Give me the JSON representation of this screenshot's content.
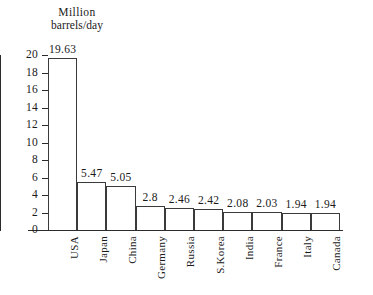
{
  "chart_data": {
    "type": "bar",
    "title": "",
    "ylabel_line1": "Million",
    "ylabel_line2": "barrels/day",
    "xlabel": "",
    "ylim": [
      0,
      20
    ],
    "ytick_step": 2,
    "yticks": [
      "20",
      "18",
      "16",
      "14",
      "12",
      "10",
      "8",
      "6",
      "4",
      "2",
      "0"
    ],
    "grid": false,
    "legend": false,
    "categories": [
      "USA",
      "Japan",
      "China",
      "Germany",
      "Russia",
      "S.Korea",
      "India",
      "France",
      "Italy",
      "Canada"
    ],
    "values": [
      19.63,
      5.47,
      5.05,
      2.8,
      2.46,
      2.42,
      2.08,
      2.03,
      1.94,
      1.94
    ],
    "value_labels": [
      "19.63",
      "5.47",
      "5.05",
      "2.8",
      "2.46",
      "2.42",
      "2.08",
      "2.03",
      "1.94",
      "1.94"
    ],
    "colors": {
      "bar_fill": "#ffffff",
      "bar_stroke": "#3a3a3a",
      "axis": "#2b2b2b",
      "text": "#1a1a1a",
      "background": "#ffffff"
    }
  }
}
